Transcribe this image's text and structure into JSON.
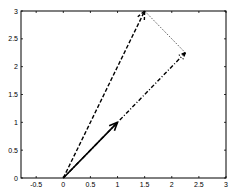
{
  "chart_data": {
    "type": "line",
    "title": "",
    "xlabel": "",
    "ylabel": "",
    "xlim": [
      -0.78,
      3
    ],
    "ylim": [
      0,
      3
    ],
    "grid": false,
    "legend": null,
    "x_ticks": [
      -0.5,
      0,
      0.5,
      1,
      1.5,
      2,
      2.5,
      3
    ],
    "x_tick_labels": [
      "-0.5",
      "0",
      "0.5",
      "1",
      "1.5",
      "2",
      "2.5",
      "3"
    ],
    "y_ticks": [
      0,
      0.5,
      1,
      1.5,
      2,
      2.5,
      3
    ],
    "y_tick_labels": [
      "0",
      "0.5",
      "1",
      "1.5",
      "2",
      "2.5",
      "3"
    ],
    "series": [
      {
        "name": "vector-solid",
        "style": "solid",
        "width": 1.6,
        "arrow": true,
        "x": [
          0,
          1
        ],
        "y": [
          0,
          1
        ]
      },
      {
        "name": "vector-dashed",
        "style": "dashed",
        "width": 1.4,
        "arrow": true,
        "x": [
          0,
          1.5
        ],
        "y": [
          0,
          3
        ]
      },
      {
        "name": "vector-dashdot",
        "style": "dashdot",
        "width": 1.4,
        "arrow": true,
        "x": [
          0,
          2.25
        ],
        "y": [
          0,
          2.25
        ]
      },
      {
        "name": "connector-dotted",
        "style": "dotted",
        "width": 0.8,
        "arrow": false,
        "x": [
          1.5,
          2.25
        ],
        "y": [
          3,
          2.25
        ]
      }
    ]
  },
  "plot": {
    "left": 21,
    "right": 226,
    "top": 11,
    "bottom": 178,
    "axis_color": "#000000",
    "line_color": "#000000"
  }
}
